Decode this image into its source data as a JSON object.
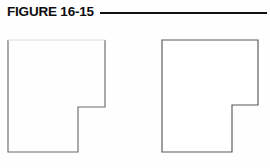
{
  "figure": {
    "label": "FIGURE 16-15",
    "rule_color": "#111111",
    "background_color": "#fefefe",
    "outline_color": "#58585a"
  },
  "canvas": {
    "width": 270,
    "height": 168
  },
  "header": {
    "rule": {
      "x_start": 100,
      "x_end": 267,
      "y": 13,
      "thickness": 2.6
    }
  },
  "shapes": [
    {
      "name": "left-polygon",
      "description": "L-shaped polygon with notch removed from lower-right",
      "closed": false,
      "top_edge_visible": false,
      "bounds": {
        "x_min": 8,
        "y_min": 40,
        "x_max": 105,
        "y_max": 152
      },
      "notch_corner": {
        "x": 78,
        "y": 107
      },
      "points": "8,40 8,152 78,152 78,107 105,107 105,40"
    },
    {
      "name": "right-polygon",
      "description": "L-shaped polygon with notch removed from lower-right",
      "closed": true,
      "top_edge_visible": true,
      "bounds": {
        "x_min": 162,
        "y_min": 40,
        "x_max": 258,
        "y_max": 152
      },
      "notch_corner": {
        "x": 232,
        "y": 105
      },
      "points": "162,40 258,40 258,105 232,105 232,152 162,152"
    }
  ]
}
